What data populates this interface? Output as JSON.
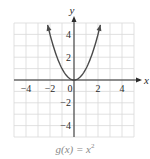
{
  "chart_data": {
    "type": "line",
    "title": "",
    "caption_prefix": "g(x) = x",
    "caption_exponent": "2",
    "xlabel": "x",
    "ylabel": "y",
    "xlim": [
      -5,
      5
    ],
    "ylim": [
      -5,
      5
    ],
    "grid": true,
    "grid_step": 1,
    "x_ticks": [
      -4,
      -2,
      0,
      2,
      4
    ],
    "x_tick_labels": [
      "−4",
      "−2",
      "0",
      "2",
      "4"
    ],
    "y_ticks": [
      4,
      2,
      -2,
      -4
    ],
    "y_tick_labels": [
      "4",
      "2",
      "−2",
      "−4"
    ],
    "series": [
      {
        "name": "g(x) = x^2",
        "function": "x^2",
        "x": [
          -2.2,
          -2,
          -1.5,
          -1,
          -0.5,
          0,
          0.5,
          1,
          1.5,
          2,
          2.2
        ],
        "y": [
          4.84,
          4,
          2.25,
          1,
          0.25,
          0,
          0.25,
          1,
          2.25,
          4,
          4.84
        ],
        "arrows_at_ends": true
      }
    ],
    "colors": {
      "curve": "#4a4a4a",
      "axis": "#2b2b2b",
      "grid": "#d9d9d9",
      "caption": "#8a8a8a"
    }
  }
}
